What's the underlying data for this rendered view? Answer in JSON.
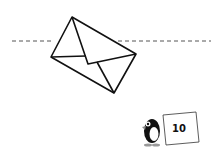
{
  "scene": {
    "fold_line": {
      "style": "dashed",
      "color": "#555555"
    },
    "envelope": {
      "stroke": "#111111"
    },
    "mascot": {
      "name": "penguin",
      "card_number": "10"
    }
  }
}
